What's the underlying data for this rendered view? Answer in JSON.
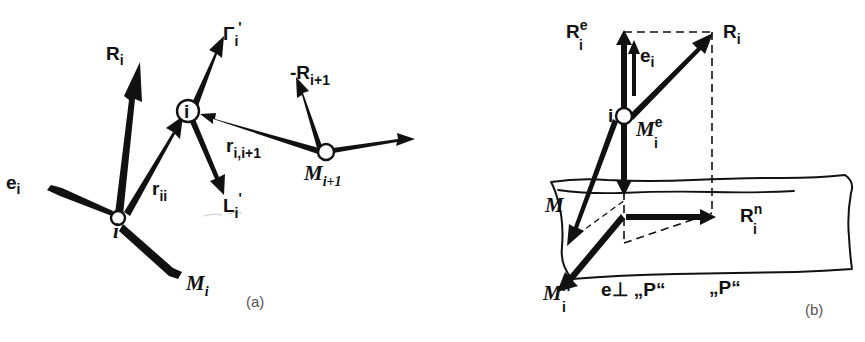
{
  "figure": {
    "background_color": "#ffffff",
    "ink_color": "#111111",
    "caption_color": "#555555",
    "width": 865,
    "height": 342
  },
  "panel_a": {
    "caption": "(a)",
    "nodes": [
      {
        "name": "node-i-left",
        "label": "i",
        "x": 118,
        "y": 218
      },
      {
        "name": "node-i-middle",
        "label": "i",
        "x": 188,
        "y": 111
      },
      {
        "name": "node-m-i-plus-1",
        "label": "",
        "x": 326,
        "y": 152
      }
    ],
    "labels": {
      "e_i": {
        "base": "e",
        "sub": "i",
        "sup": ""
      },
      "R_i": {
        "base": "R",
        "sub": "i",
        "sup": ""
      },
      "M_i": {
        "base": "M",
        "sub": "i",
        "sup": ""
      },
      "r_ii": {
        "base": "r",
        "sub": "ii",
        "sup": ""
      },
      "Gamma_i_prime": {
        "base": "Γ",
        "sub": "i",
        "sup": "",
        "prime": "'"
      },
      "L_i_prime": {
        "base": "L",
        "sub": "i",
        "sup": "",
        "prime": "'"
      },
      "r_i_i_plus_1": {
        "base": "r",
        "sub": "i,i+1",
        "sup": ""
      },
      "minus_R_i_plus_1": {
        "base": "-R",
        "sub": "i+1",
        "sup": ""
      },
      "M_i_plus_1": {
        "base": "M",
        "sub": "i+1",
        "sup": ""
      }
    }
  },
  "panel_b": {
    "caption": "(b)",
    "nodes": [
      {
        "name": "node-i",
        "label": "i",
        "x": 624,
        "y": 116
      }
    ],
    "labels": {
      "R_i_e": {
        "base": "R",
        "sub": "i",
        "sup": "e"
      },
      "R_i": {
        "base": "R",
        "sub": "i",
        "sup": ""
      },
      "e_i": {
        "base": "e",
        "sub": "i",
        "sup": ""
      },
      "M_i_e": {
        "base": "M",
        "sub": "i",
        "sup": "e"
      },
      "M": {
        "base": "M",
        "sub": "",
        "sup": ""
      },
      "R_i_n": {
        "base": "R",
        "sub": "i",
        "sup": "n"
      },
      "M_i_n": {
        "base": "M",
        "sub": "i",
        "sup": "n"
      },
      "e_perp_P": "e⊥ „P“",
      "P_plane": "„P“"
    }
  }
}
